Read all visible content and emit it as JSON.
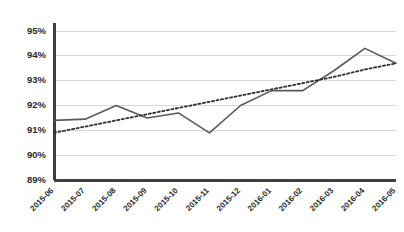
{
  "chart_data": {
    "type": "line",
    "title": "",
    "xlabel": "",
    "ylabel": "",
    "ylim": [
      89,
      95
    ],
    "ytick_values": [
      89,
      90,
      91,
      92,
      93,
      94,
      95
    ],
    "ytick_labels": [
      "89%",
      "90%",
      "91%",
      "92%",
      "93%",
      "94%",
      "95%"
    ],
    "grid": true,
    "legend": false,
    "categories": [
      "2015-06",
      "2015-07",
      "2015-08",
      "2015-09",
      "2015-10",
      "2015-11",
      "2015-12",
      "2016-01",
      "2016-02",
      "2016-03",
      "2016-04",
      "2016-05"
    ],
    "series": [
      {
        "name": "value",
        "style": "solid",
        "color": "#595959",
        "values": [
          91.4,
          91.45,
          92.0,
          91.5,
          91.7,
          90.9,
          92.0,
          92.6,
          92.6,
          93.4,
          94.3,
          93.7
        ]
      },
      {
        "name": "trendline",
        "style": "dotted",
        "color": "#2f2f2f",
        "values": [
          90.9,
          91.15,
          91.4,
          91.65,
          91.9,
          92.15,
          92.4,
          92.65,
          92.9,
          93.15,
          93.45,
          93.7
        ]
      }
    ]
  },
  "colors": {
    "axis": "#3f3f3f",
    "grid": "#d9d9d9",
    "series": "#595959",
    "trend": "#2f2f2f",
    "text": "#2b2b2b",
    "background": "#ffffff"
  }
}
